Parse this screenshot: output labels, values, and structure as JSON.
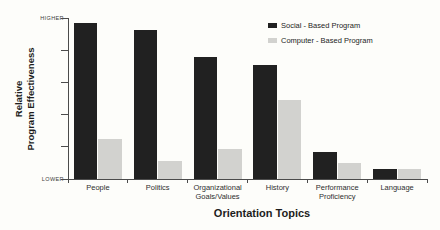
{
  "y_axis": {
    "title_lines": [
      "Relative",
      "Program Effectiveness"
    ],
    "top_label": "HIGHER",
    "bottom_label": "LOWER"
  },
  "x_axis": {
    "title": "Orientation Topics"
  },
  "legend": {
    "items": [
      {
        "label": "Social - Based Program",
        "color": "#212121"
      },
      {
        "label": "Computer - Based Program",
        "color": "#d2d2cf"
      }
    ]
  },
  "chart_data": {
    "type": "bar",
    "title": "",
    "xlabel": "Orientation Topics",
    "ylabel": "Relative Program Effectiveness",
    "categories": [
      "People",
      "Politics",
      "Organizational\nGoals/Values",
      "History",
      "Performance\nProficiency",
      "Language"
    ],
    "series": [
      {
        "name": "Social - Based Program",
        "color": "#212121",
        "values": [
          97,
          93,
          76,
          71,
          17,
          6
        ]
      },
      {
        "name": "Computer - Based Program",
        "color": "#d2d2cf",
        "values": [
          25,
          11,
          19,
          49,
          10,
          6
        ]
      }
    ],
    "ylim": [
      0,
      100
    ],
    "y_ticks_count": 6,
    "y_tick_labels": [
      "LOWER",
      "",
      "",
      "",
      "",
      "HIGHER"
    ],
    "legend_position": "top-right",
    "grid": false
  }
}
